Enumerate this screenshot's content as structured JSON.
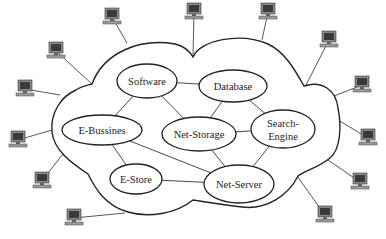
{
  "diagram": {
    "type": "cloud-network",
    "colors": {
      "stroke": "#222222",
      "background": "#ffffff",
      "monitor_body": "#8a8a8a",
      "monitor_screen": "#3a3a3a"
    },
    "nodes": [
      {
        "id": "software",
        "label": "Software",
        "cx": 147,
        "cy": 81,
        "rx": 30,
        "ry": 17
      },
      {
        "id": "database",
        "label": "Database",
        "cx": 233,
        "cy": 86,
        "rx": 34,
        "ry": 16
      },
      {
        "id": "e-bussines",
        "label": "E-Bussines",
        "cx": 102,
        "cy": 130,
        "rx": 40,
        "ry": 15
      },
      {
        "id": "net-storage",
        "label": "Net-Storage",
        "cx": 199,
        "cy": 134,
        "rx": 37,
        "ry": 17
      },
      {
        "id": "search-engine",
        "label": "Search-",
        "label2": "Engine",
        "cx": 283,
        "cy": 129,
        "rx": 32,
        "ry": 19
      },
      {
        "id": "e-store",
        "label": "E-Store",
        "cx": 136,
        "cy": 179,
        "rx": 26,
        "ry": 15
      },
      {
        "id": "net-server",
        "label": "Net-Server",
        "cx": 239,
        "cy": 184,
        "rx": 35,
        "ry": 19
      }
    ],
    "edges": [
      [
        "software",
        "database"
      ],
      [
        "software",
        "e-bussines"
      ],
      [
        "software",
        "net-storage"
      ],
      [
        "database",
        "net-storage"
      ],
      [
        "database",
        "search-engine"
      ],
      [
        "net-storage",
        "search-engine"
      ],
      [
        "net-storage",
        "net-server"
      ],
      [
        "e-bussines",
        "e-store"
      ],
      [
        "e-bussines",
        "net-server"
      ],
      [
        "e-store",
        "net-server"
      ],
      [
        "search-engine",
        "net-server"
      ]
    ],
    "computers": [
      {
        "x": 103,
        "y": 8,
        "link": [
          127,
          43
        ]
      },
      {
        "x": 47,
        "y": 42,
        "link": [
          92,
          84
        ]
      },
      {
        "x": 16,
        "y": 80,
        "link": [
          60,
          95
        ]
      },
      {
        "x": 9,
        "y": 131,
        "link": [
          52,
          130
        ]
      },
      {
        "x": 33,
        "y": 172,
        "link": [
          66,
          150
        ]
      },
      {
        "x": 65,
        "y": 209,
        "link": [
          125,
          213
        ]
      },
      {
        "x": 185,
        "y": 3,
        "link": [
          193,
          56
        ]
      },
      {
        "x": 259,
        "y": 3,
        "link": [
          262,
          40
        ]
      },
      {
        "x": 320,
        "y": 31,
        "link": [
          306,
          85
        ]
      },
      {
        "x": 353,
        "y": 76,
        "link": [
          329,
          98
        ]
      },
      {
        "x": 359,
        "y": 129,
        "link": [
          338,
          120
        ]
      },
      {
        "x": 351,
        "y": 173,
        "link": [
          328,
          160
        ]
      },
      {
        "x": 316,
        "y": 206,
        "link": [
          297,
          176
        ]
      }
    ]
  }
}
